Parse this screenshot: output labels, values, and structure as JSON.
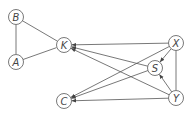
{
  "diagram": {
    "type": "directed-graph",
    "nodes": [
      {
        "id": "B",
        "label": "B",
        "x": 16,
        "y": 17
      },
      {
        "id": "A",
        "label": "A",
        "x": 16,
        "y": 62
      },
      {
        "id": "K",
        "label": "K",
        "x": 64,
        "y": 45
      },
      {
        "id": "C",
        "label": "C",
        "x": 64,
        "y": 101
      },
      {
        "id": "X",
        "label": "X",
        "x": 176,
        "y": 43
      },
      {
        "id": "S",
        "label": "S",
        "x": 155,
        "y": 68
      },
      {
        "id": "Y",
        "label": "Y",
        "x": 176,
        "y": 98
      }
    ],
    "edges": [
      {
        "from": "B",
        "to": "A",
        "directed": false
      },
      {
        "from": "B",
        "to": "K",
        "directed": false
      },
      {
        "from": "A",
        "to": "K",
        "directed": false
      },
      {
        "from": "X",
        "to": "Y",
        "directed": false
      },
      {
        "from": "X",
        "to": "K",
        "directed": true
      },
      {
        "from": "S",
        "to": "K",
        "directed": true
      },
      {
        "from": "Y",
        "to": "K",
        "directed": true
      },
      {
        "from": "X",
        "to": "C",
        "directed": true
      },
      {
        "from": "S",
        "to": "C",
        "directed": true
      },
      {
        "from": "Y",
        "to": "C",
        "directed": true
      },
      {
        "from": "X",
        "to": "S",
        "directed": true
      },
      {
        "from": "Y",
        "to": "S",
        "directed": true
      }
    ],
    "colors": {
      "stroke": "#555555",
      "node_fill": "#ffffff"
    }
  }
}
